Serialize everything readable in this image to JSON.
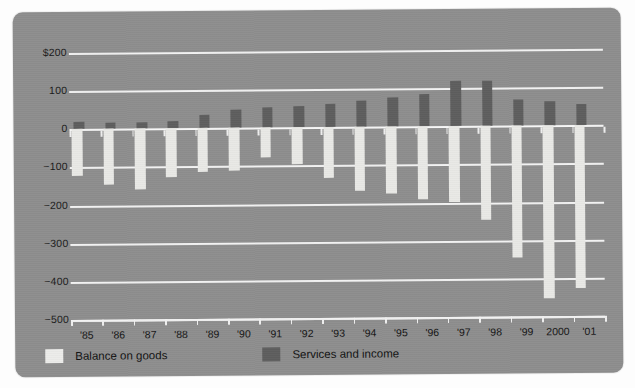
{
  "chart_data": {
    "type": "bar",
    "title": "",
    "xlabel": "",
    "ylabel": "",
    "ylim": [
      -500,
      200
    ],
    "yticks": [
      200,
      100,
      0,
      -100,
      -200,
      -300,
      -400,
      -500
    ],
    "ytick_labels": [
      "$200",
      "100",
      "0",
      "−100",
      "−200",
      "−300",
      "−400",
      "−500"
    ],
    "grid": true,
    "legend_position": "bottom-left",
    "categories": [
      "'85",
      "'86",
      "'87",
      "'88",
      "'89",
      "'90",
      "'91",
      "'92",
      "'93",
      "'94",
      "'95",
      "'96",
      "'97",
      "'98",
      "'99",
      "2000",
      "'01"
    ],
    "series": [
      {
        "name": "Balance on goods",
        "color": "#e9e9e6",
        "values": [
          -122,
          -145,
          -160,
          -127,
          -115,
          -111,
          -77,
          -97,
          -133,
          -166,
          -174,
          -191,
          -198,
          -247,
          -346,
          -452,
          -427
        ]
      },
      {
        "name": "Services and income",
        "color": "#5e5e5e",
        "values": [
          20,
          17,
          16,
          20,
          35,
          47,
          53,
          56,
          62,
          70,
          76,
          85,
          118,
          119,
          68,
          63,
          57
        ]
      }
    ]
  },
  "legend": {
    "items": [
      {
        "label": "Balance on goods",
        "swatch": "light"
      },
      {
        "label": "Services and income",
        "swatch": "dark"
      }
    ]
  },
  "colors": {
    "panel_background": "#8e8e8e",
    "gridline": "#f2f2f2",
    "series_light": "#e9e9e6",
    "series_dark": "#5e5e5e",
    "text": "#141414"
  }
}
